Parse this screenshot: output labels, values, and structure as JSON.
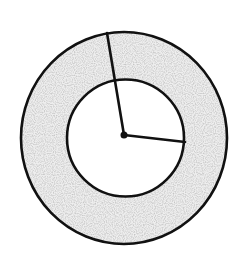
{
  "diagram": {
    "type": "concentric-circles-annulus",
    "canvas": {
      "width": 246,
      "height": 258
    },
    "colors": {
      "background": "#ffffff",
      "stroke": "#111111",
      "annulus_fill": "#eeeeee",
      "inner_fill": "#ffffff"
    },
    "outer_circle": {
      "cx": 124,
      "cy": 138,
      "rx": 103,
      "ry": 106
    },
    "inner_circle": {
      "cx": 125.5,
      "cy": 138,
      "r": 58.5
    },
    "center_point": {
      "cx": 124,
      "cy": 135,
      "r": 3.5
    },
    "outer_radius_line": {
      "x1": 124,
      "y1": 135,
      "x2": 107,
      "y2": 33
    },
    "inner_radius_line": {
      "x1": 124,
      "y1": 135,
      "x2": 185,
      "y2": 142
    },
    "labels": []
  }
}
